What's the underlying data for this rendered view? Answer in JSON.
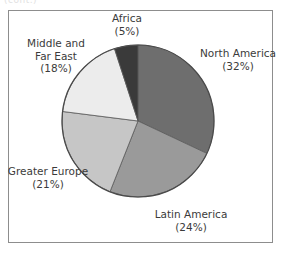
{
  "figure": {
    "background_color": "#ffffff",
    "frame_color": "#8d8d8d",
    "crop_remnant_text": "(cont.)"
  },
  "chart_data": {
    "type": "pie",
    "title": "",
    "xlabel": "",
    "ylabel": "",
    "grid": false,
    "legend": "none",
    "label_format": "name on first line(s), percent in parentheses below",
    "start_angle_deg": 0,
    "direction": "clockwise",
    "units": "percent",
    "categories": [
      "North America",
      "Latin America",
      "Greater Europe",
      "Middle and Far East",
      "Africa"
    ],
    "values": [
      32,
      24,
      21,
      18,
      5
    ],
    "colors": [
      "#6e6e6e",
      "#9a9a9a",
      "#c6c6c6",
      "#ececec",
      "#3a3a3a"
    ],
    "slices": [
      {
        "name": "North America",
        "value": 32,
        "percent_label": "(32%)",
        "color": "#6e6e6e",
        "start_deg": 0,
        "end_deg": 115.2
      },
      {
        "name": "Latin America",
        "value": 24,
        "percent_label": "(24%)",
        "color": "#9a9a9a",
        "start_deg": 115.2,
        "end_deg": 201.6
      },
      {
        "name": "Greater Europe",
        "value": 21,
        "percent_label": "(21%)",
        "color": "#c6c6c6",
        "start_deg": 201.6,
        "end_deg": 277.2
      },
      {
        "name": "Middle and Far East",
        "value": 18,
        "percent_label": "(18%)",
        "color": "#ececec",
        "start_deg": 277.2,
        "end_deg": 342.0
      },
      {
        "name": "Africa",
        "value": 5,
        "percent_label": "(5%)",
        "color": "#3a3a3a",
        "start_deg": 342.0,
        "end_deg": 360.0
      }
    ]
  },
  "labels": {
    "africa": {
      "line1": "Africa",
      "pct": "(5%)"
    },
    "north_america": {
      "line1": "North America",
      "pct": "(32%)"
    },
    "latin_america": {
      "line1": "Latin America",
      "pct": "(24%)"
    },
    "greater_europe": {
      "line1": "Greater Europe",
      "pct": "(21%)"
    },
    "middle_far_east": {
      "line1": "Middle and",
      "line2": "Far East",
      "pct": "(18%)"
    }
  }
}
